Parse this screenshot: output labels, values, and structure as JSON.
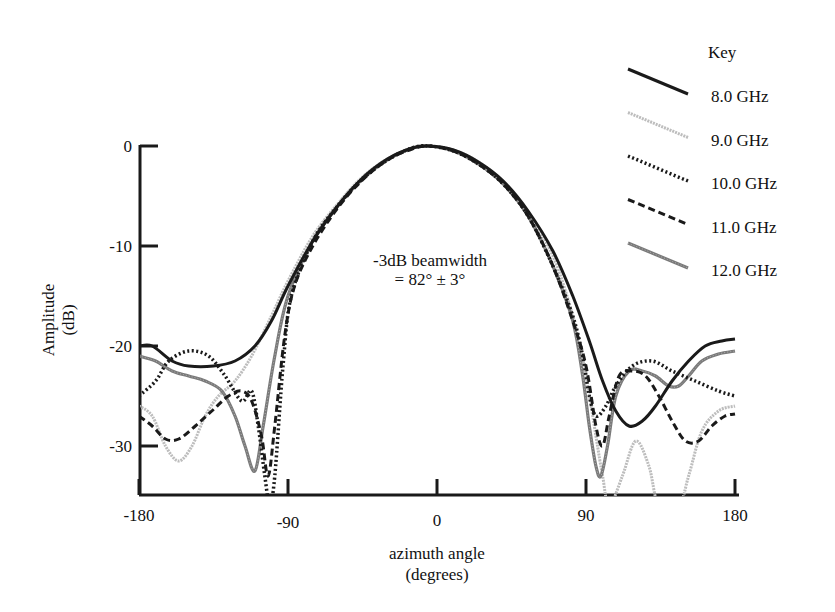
{
  "chart_data": {
    "type": "line",
    "title": "",
    "xlabel": "azimuth angle",
    "xlabel_unit": "(degrees)",
    "ylabel": "Amplitude",
    "ylabel_unit": "(dB)",
    "xlim": [
      -180,
      180
    ],
    "ylim": [
      -35,
      0
    ],
    "x_ticks": [
      -180,
      -90,
      0,
      90,
      180
    ],
    "y_ticks": [
      0,
      -10,
      -20,
      -30
    ],
    "x_tick_labels": [
      "-180",
      "-90",
      "0",
      "90",
      "180"
    ],
    "y_tick_labels": [
      "0",
      "-10",
      "-20",
      "-30"
    ],
    "grid": false,
    "legend_title": "Key",
    "legend_position": "top-right",
    "annotation": {
      "line1": "-3dB beamwidth",
      "line2": "= 82° ± 3°"
    },
    "series": [
      {
        "name": "8.0 GHz",
        "style": "solid-black-thick",
        "points": [
          [
            -180,
            -20
          ],
          [
            -172,
            -20
          ],
          [
            -160,
            -21.5
          ],
          [
            -150,
            -22
          ],
          [
            -135,
            -22
          ],
          [
            -122,
            -21.5
          ],
          [
            -110,
            -20
          ],
          [
            -100,
            -17.5
          ],
          [
            -90,
            -14
          ],
          [
            -75,
            -9.5
          ],
          [
            -60,
            -6
          ],
          [
            -45,
            -3.2
          ],
          [
            -30,
            -1.3
          ],
          [
            -15,
            -0.2
          ],
          [
            -5,
            0
          ],
          [
            10,
            -0.4
          ],
          [
            25,
            -1.6
          ],
          [
            40,
            -3.5
          ],
          [
            55,
            -6.5
          ],
          [
            70,
            -10.5
          ],
          [
            82,
            -15
          ],
          [
            92,
            -19.5
          ],
          [
            100,
            -23.5
          ],
          [
            108,
            -26.5
          ],
          [
            116,
            -28
          ],
          [
            124,
            -27.5
          ],
          [
            132,
            -26
          ],
          [
            142,
            -23.5
          ],
          [
            152,
            -21.5
          ],
          [
            162,
            -20
          ],
          [
            172,
            -19.5
          ],
          [
            180,
            -19.3
          ]
        ]
      },
      {
        "name": "9.0 GHz",
        "style": "light-gray-hatched",
        "points": [
          [
            -180,
            -26
          ],
          [
            -172,
            -27
          ],
          [
            -164,
            -30
          ],
          [
            -156,
            -31.5
          ],
          [
            -148,
            -30
          ],
          [
            -140,
            -27
          ],
          [
            -132,
            -25
          ],
          [
            -122,
            -23.5
          ],
          [
            -112,
            -21
          ],
          [
            -100,
            -17
          ],
          [
            -90,
            -13.5
          ],
          [
            -75,
            -9
          ],
          [
            -60,
            -5.8
          ],
          [
            -45,
            -3.1
          ],
          [
            -30,
            -1.3
          ],
          [
            -15,
            -0.2
          ],
          [
            -5,
            0
          ],
          [
            10,
            -0.4
          ],
          [
            25,
            -1.6
          ],
          [
            40,
            -3.6
          ],
          [
            55,
            -6.8
          ],
          [
            70,
            -11
          ],
          [
            82,
            -17
          ],
          [
            90,
            -23
          ],
          [
            96,
            -29
          ],
          [
            100,
            -33
          ],
          [
            104,
            -36
          ],
          [
            112,
            -33
          ],
          [
            120,
            -29.5
          ],
          [
            128,
            -32
          ],
          [
            134,
            -36
          ],
          [
            146,
            -36
          ],
          [
            152,
            -33
          ],
          [
            160,
            -28.5
          ],
          [
            170,
            -26.5
          ],
          [
            180,
            -26
          ]
        ]
      },
      {
        "name": "10.0 GHz",
        "style": "dotted-black",
        "points": [
          [
            -180,
            -25
          ],
          [
            -170,
            -23.5
          ],
          [
            -162,
            -21.5
          ],
          [
            -150,
            -20.5
          ],
          [
            -138,
            -21
          ],
          [
            -128,
            -23
          ],
          [
            -118,
            -25.5
          ],
          [
            -112,
            -24.5
          ],
          [
            -108,
            -28
          ],
          [
            -104,
            -33
          ],
          [
            -101,
            -36
          ],
          [
            -98,
            -33
          ],
          [
            -93,
            -22
          ],
          [
            -88,
            -15
          ],
          [
            -75,
            -9.5
          ],
          [
            -60,
            -6
          ],
          [
            -45,
            -3.3
          ],
          [
            -30,
            -1.4
          ],
          [
            -15,
            -0.2
          ],
          [
            -5,
            0
          ],
          [
            10,
            -0.5
          ],
          [
            25,
            -1.8
          ],
          [
            40,
            -3.8
          ],
          [
            55,
            -7
          ],
          [
            70,
            -12
          ],
          [
            82,
            -17
          ],
          [
            88,
            -21
          ],
          [
            92,
            -25
          ],
          [
            96,
            -27
          ],
          [
            102,
            -26
          ],
          [
            108,
            -24
          ],
          [
            118,
            -22
          ],
          [
            130,
            -21.5
          ],
          [
            142,
            -22.5
          ],
          [
            156,
            -23.5
          ],
          [
            170,
            -24.5
          ],
          [
            180,
            -25
          ]
        ]
      },
      {
        "name": "11.0 GHz",
        "style": "dashed-black",
        "points": [
          [
            -180,
            -27
          ],
          [
            -172,
            -28
          ],
          [
            -164,
            -29.3
          ],
          [
            -156,
            -29.3
          ],
          [
            -146,
            -28
          ],
          [
            -136,
            -26.5
          ],
          [
            -126,
            -25
          ],
          [
            -118,
            -24.5
          ],
          [
            -112,
            -25.5
          ],
          [
            -106,
            -29
          ],
          [
            -102,
            -33
          ],
          [
            -98,
            -28
          ],
          [
            -92,
            -19
          ],
          [
            -86,
            -14
          ],
          [
            -75,
            -10
          ],
          [
            -60,
            -6.2
          ],
          [
            -45,
            -3.4
          ],
          [
            -30,
            -1.4
          ],
          [
            -15,
            -0.3
          ],
          [
            -5,
            0
          ],
          [
            10,
            -0.5
          ],
          [
            25,
            -1.8
          ],
          [
            40,
            -3.8
          ],
          [
            55,
            -7
          ],
          [
            70,
            -12
          ],
          [
            82,
            -17.5
          ],
          [
            90,
            -22
          ],
          [
            96,
            -28
          ],
          [
            100,
            -30
          ],
          [
            104,
            -27
          ],
          [
            110,
            -23
          ],
          [
            118,
            -22.5
          ],
          [
            126,
            -23
          ],
          [
            134,
            -25
          ],
          [
            142,
            -27.5
          ],
          [
            150,
            -29.5
          ],
          [
            158,
            -29.5
          ],
          [
            166,
            -28
          ],
          [
            174,
            -27
          ],
          [
            180,
            -26.8
          ]
        ]
      },
      {
        "name": "12.0 GHz",
        "style": "medium-gray-textured",
        "points": [
          [
            -180,
            -21
          ],
          [
            -170,
            -21.5
          ],
          [
            -160,
            -22.5
          ],
          [
            -150,
            -23
          ],
          [
            -140,
            -23.5
          ],
          [
            -130,
            -24.5
          ],
          [
            -122,
            -27
          ],
          [
            -116,
            -30
          ],
          [
            -110,
            -32.5
          ],
          [
            -105,
            -28
          ],
          [
            -98,
            -21
          ],
          [
            -90,
            -15
          ],
          [
            -75,
            -9.5
          ],
          [
            -60,
            -6
          ],
          [
            -45,
            -3.3
          ],
          [
            -30,
            -1.4
          ],
          [
            -15,
            -0.2
          ],
          [
            -5,
            0
          ],
          [
            10,
            -0.5
          ],
          [
            25,
            -1.8
          ],
          [
            40,
            -3.8
          ],
          [
            55,
            -7
          ],
          [
            70,
            -12
          ],
          [
            82,
            -17.5
          ],
          [
            88,
            -23
          ],
          [
            92,
            -28
          ],
          [
            96,
            -32
          ],
          [
            99,
            -33
          ],
          [
            103,
            -30
          ],
          [
            108,
            -25
          ],
          [
            116,
            -22.5
          ],
          [
            124,
            -22.5
          ],
          [
            132,
            -23
          ],
          [
            140,
            -24
          ],
          [
            146,
            -24
          ],
          [
            152,
            -23
          ],
          [
            160,
            -21.5
          ],
          [
            170,
            -20.8
          ],
          [
            180,
            -20.5
          ]
        ]
      }
    ]
  },
  "legend": {
    "title": "Key",
    "items": [
      "8.0 GHz",
      "9.0 GHz",
      "10.0 GHz",
      "11.0 GHz",
      "12.0 GHz"
    ]
  }
}
